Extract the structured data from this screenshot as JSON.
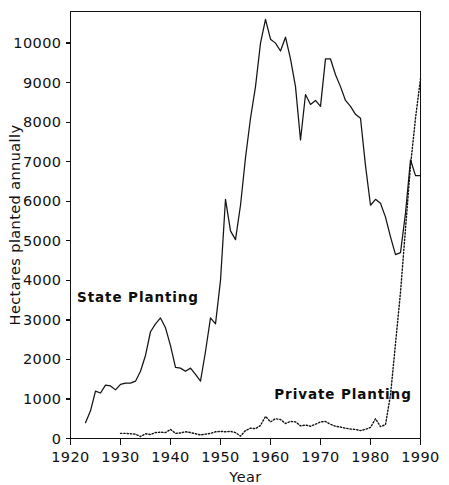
{
  "chart_data": {
    "type": "line",
    "title": "",
    "xlabel": "Year",
    "ylabel": "Hectares planted annually",
    "xlim": [
      1920,
      1990
    ],
    "ylim": [
      0,
      10800
    ],
    "grid": false,
    "legend_position": "inline-annotation",
    "xticks": [
      1920,
      1930,
      1940,
      1950,
      1960,
      1970,
      1980,
      1990
    ],
    "xtick_labels": [
      "1920",
      "1930",
      "1940",
      "1950",
      "1960",
      "1970",
      "1980",
      "1990"
    ],
    "yticks": [
      0,
      1000,
      2000,
      3000,
      4000,
      5000,
      6000,
      7000,
      8000,
      9000,
      10000
    ],
    "ytick_labels": [
      "0",
      "1000",
      "2000",
      "3000",
      "4000",
      "5000",
      "6000",
      "7000",
      "8000",
      "9000",
      "10000"
    ],
    "annotations": [
      {
        "text": "State Planting",
        "x": 1933.5,
        "y": 3450
      },
      {
        "text": "Private Planting",
        "x": 1974.5,
        "y": 1010
      }
    ],
    "series": [
      {
        "name": "State Planting",
        "style": "solid",
        "color": "#141414",
        "x": [
          1923,
          1924,
          1925,
          1926,
          1927,
          1928,
          1929,
          1930,
          1931,
          1932,
          1933,
          1934,
          1935,
          1936,
          1937,
          1938,
          1939,
          1940,
          1941,
          1942,
          1943,
          1944,
          1945,
          1946,
          1947,
          1948,
          1949,
          1950,
          1951,
          1952,
          1953,
          1954,
          1955,
          1956,
          1957,
          1958,
          1959,
          1960,
          1961,
          1962,
          1963,
          1964,
          1965,
          1966,
          1967,
          1968,
          1969,
          1970,
          1971,
          1972,
          1973,
          1974,
          1975,
          1976,
          1977,
          1978,
          1979,
          1980,
          1981,
          1982,
          1983,
          1984,
          1985,
          1986,
          1987,
          1988,
          1989,
          1990
        ],
        "values": [
          400,
          700,
          1200,
          1150,
          1350,
          1330,
          1230,
          1370,
          1400,
          1400,
          1450,
          1700,
          2100,
          2700,
          2900,
          3050,
          2800,
          2350,
          1800,
          1780,
          1700,
          1780,
          1620,
          1450,
          2200,
          3050,
          2900,
          4000,
          6050,
          5250,
          5030,
          5900,
          7100,
          8100,
          8900,
          10000,
          10600,
          10100,
          10000,
          9800,
          10150,
          9600,
          8900,
          7550,
          8700,
          8450,
          8550,
          8400,
          9600,
          9600,
          9200,
          8900,
          8550,
          8400,
          8200,
          8100,
          6900,
          5900,
          6050,
          5950,
          5600,
          5100,
          4650,
          4700,
          5700,
          7050,
          6650,
          6650
        ]
      },
      {
        "name": "Private Planting",
        "style": "dotted",
        "color": "#141414",
        "x": [
          1930,
          1931,
          1932,
          1933,
          1934,
          1935,
          1936,
          1937,
          1938,
          1939,
          1940,
          1941,
          1942,
          1943,
          1944,
          1945,
          1946,
          1947,
          1948,
          1949,
          1950,
          1951,
          1952,
          1953,
          1954,
          1955,
          1956,
          1957,
          1958,
          1959,
          1960,
          1961,
          1962,
          1963,
          1964,
          1965,
          1966,
          1967,
          1968,
          1969,
          1970,
          1971,
          1972,
          1973,
          1974,
          1975,
          1976,
          1977,
          1978,
          1979,
          1980,
          1981,
          1982,
          1983,
          1984,
          1985,
          1986,
          1987,
          1988,
          1989,
          1990
        ],
        "values": [
          130,
          130,
          120,
          110,
          50,
          120,
          100,
          150,
          160,
          150,
          230,
          130,
          140,
          170,
          150,
          120,
          90,
          110,
          130,
          170,
          180,
          170,
          180,
          150,
          60,
          200,
          260,
          250,
          330,
          560,
          420,
          500,
          480,
          380,
          430,
          420,
          320,
          340,
          310,
          360,
          420,
          430,
          360,
          310,
          290,
          260,
          240,
          230,
          200,
          230,
          280,
          500,
          300,
          350,
          1100,
          2400,
          3700,
          5300,
          6900,
          8100,
          9100
        ]
      }
    ]
  }
}
